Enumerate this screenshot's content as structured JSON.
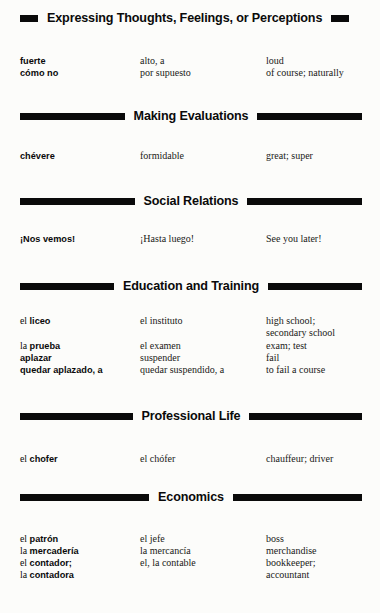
{
  "document": {
    "type": "spanish-english-vocabulary-reference",
    "background_color": "#fcfcfa",
    "rule_color": "#0a0a0a"
  },
  "sections": [
    {
      "id": "expressing-thoughts-feelings-or-perceptions",
      "title": "Expressing Thoughts, Feelings, or Perceptions",
      "bar_left_flex": 0.06,
      "bar_right_flex": 0.06,
      "top": 12,
      "entries": [
        {
          "top": 55,
          "spanish_article": "",
          "spanish_term": "fuerte",
          "synonym": "alto, a",
          "english": "loud"
        },
        {
          "top": 67,
          "spanish_article": "",
          "spanish_term": "cómo no",
          "synonym": "por supuesto",
          "english": "of course; naturally"
        }
      ]
    },
    {
      "id": "making-evaluations",
      "title": "Making Evaluations",
      "bar_left_flex": 1,
      "bar_right_flex": 1,
      "top": 110,
      "entries": [
        {
          "top": 150,
          "spanish_article": "",
          "spanish_term": "chévere",
          "synonym": "formidable",
          "english": "great; super"
        }
      ]
    },
    {
      "id": "social-relations",
      "title": "Social Relations",
      "bar_left_flex": 1,
      "bar_right_flex": 1,
      "top": 195,
      "entries": [
        {
          "top": 233,
          "spanish_article": "",
          "spanish_term": "¡Nos vemos!",
          "synonym": "¡Hasta luego!",
          "english": "See you later!"
        }
      ]
    },
    {
      "id": "education-and-training",
      "title": "Education and Training",
      "bar_left_flex": 1,
      "bar_right_flex": 1,
      "top": 280,
      "entries": [
        {
          "top": 315,
          "spanish_article": "el ",
          "spanish_term": "liceo",
          "synonym": "el instituto",
          "english": "high school;\nsecondary school"
        },
        {
          "top": 340,
          "spanish_article": "la ",
          "spanish_term": "prueba",
          "synonym": "el examen",
          "english": "exam; test"
        },
        {
          "top": 352,
          "spanish_article": "",
          "spanish_term": "aplazar",
          "synonym": "suspender",
          "english": "fail"
        },
        {
          "top": 364,
          "spanish_article": "",
          "spanish_term": "quedar aplazado, a",
          "synonym": "quedar suspendido, a",
          "english": "to fail a course"
        }
      ]
    },
    {
      "id": "professional-life",
      "title": "Professional Life",
      "bar_left_flex": 1,
      "bar_right_flex": 1,
      "top": 410,
      "entries": [
        {
          "top": 453,
          "spanish_article": "el ",
          "spanish_term": "chofer",
          "synonym": "el chófer",
          "english": "chauffeur; driver"
        }
      ]
    },
    {
      "id": "economics",
      "title": "Economics",
      "bar_left_flex": 1,
      "bar_right_flex": 1,
      "top": 491,
      "entries": [
        {
          "top": 533,
          "spanish_article": "el ",
          "spanish_term": "patrón",
          "synonym": "el jefe",
          "english": "boss"
        },
        {
          "top": 545,
          "spanish_article": "la ",
          "spanish_term": "mercadería",
          "synonym": "la mercancía",
          "english": "merchandise"
        },
        {
          "top": 557,
          "spanish_article": "el ",
          "spanish_term": "contador;",
          "synonym": "el, la contable",
          "english": "bookkeeper;"
        },
        {
          "top": 569,
          "spanish_article": "la ",
          "spanish_term": "contadora",
          "synonym": "",
          "english": "accountant"
        }
      ]
    }
  ]
}
